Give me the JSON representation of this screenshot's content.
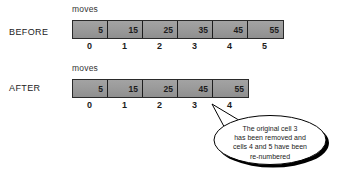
{
  "diagram": {
    "colors": {
      "cell_fill": "#9b9b9b",
      "cell_border": "#1e1e1e",
      "text": "#1c1c1c",
      "bubble_fill": "#ffffff",
      "bubble_stroke": "#000000",
      "bubble_shadow": "#000000"
    },
    "rows": [
      {
        "label": "BEFORE",
        "caption": "moves",
        "cells": [
          "5",
          "15",
          "25",
          "35",
          "45",
          "55"
        ],
        "indices": [
          "0",
          "1",
          "2",
          "3",
          "4",
          "5"
        ]
      },
      {
        "label": "AFTER",
        "caption": "moves",
        "cells": [
          "5",
          "15",
          "25",
          "45",
          "55"
        ],
        "indices": [
          "0",
          "1",
          "2",
          "3",
          "4"
        ]
      }
    ],
    "callout": {
      "lines": [
        "The original cell 3",
        "has been removed and",
        "cells 4 and 5 have been",
        "re-numbered"
      ],
      "points_to_index": "3"
    }
  }
}
